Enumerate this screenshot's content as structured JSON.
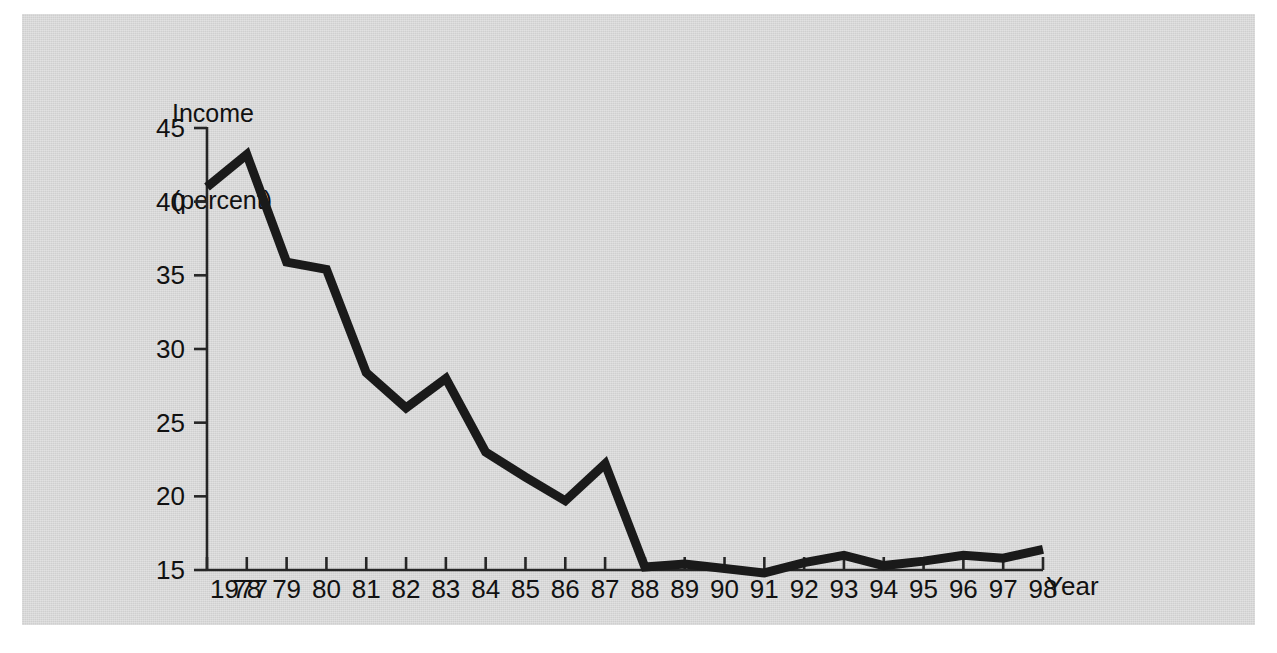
{
  "chart_data": {
    "type": "line",
    "title": "",
    "subtitle": "",
    "ylabel": "Income\n(percent)",
    "ylabel_line1": "Income",
    "ylabel_line2": "(percent)",
    "xlabel": "Year",
    "x": [
      1977,
      1978,
      1979,
      1980,
      1981,
      1982,
      1983,
      1984,
      1985,
      1986,
      1987,
      1988,
      1989,
      1990,
      1991,
      1992,
      1993,
      1994,
      1995,
      1996,
      1997,
      1998
    ],
    "categories": [
      "1977",
      "78",
      "79",
      "80",
      "81",
      "82",
      "83",
      "84",
      "85",
      "86",
      "87",
      "88",
      "89",
      "90",
      "91",
      "92",
      "93",
      "94",
      "95",
      "96",
      "97",
      "98"
    ],
    "values": [
      41.0,
      43.2,
      35.9,
      35.4,
      28.4,
      26.0,
      28.0,
      23.0,
      21.3,
      19.7,
      22.2,
      15.2,
      15.4,
      15.1,
      14.8,
      15.5,
      16.0,
      15.3,
      15.6,
      16.0,
      15.8,
      16.4
    ],
    "series": [
      {
        "name": "Income (percent)",
        "values": [
          41.0,
          43.2,
          35.9,
          35.4,
          28.4,
          26.0,
          28.0,
          23.0,
          21.3,
          19.7,
          22.2,
          15.2,
          15.4,
          15.1,
          14.8,
          15.5,
          16.0,
          15.3,
          15.6,
          16.0,
          15.8,
          16.4
        ],
        "color": "#1a1a1a"
      }
    ],
    "ylim": [
      13.2,
      46.5
    ],
    "yticks": [
      15,
      20,
      25,
      30,
      35,
      40,
      45
    ],
    "ytick_labels": [
      "15",
      "20",
      "25",
      "30",
      "35",
      "40",
      "45"
    ],
    "xlim": [
      1976.5,
      1998.5
    ],
    "grid": false,
    "legend": null,
    "legend_position": "none",
    "line_color": "#1a1a1a",
    "line_width": 9,
    "background_color": "#d6d6d6",
    "axis_color": "#262626"
  },
  "figure": {
    "background_color": "#ffffff",
    "panel_color": "#d6d6d6"
  }
}
